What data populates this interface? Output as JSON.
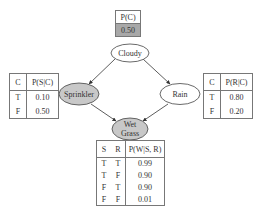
{
  "nodes": {
    "cloudy": {
      "label": "Cloudy",
      "fill": "#ffffff"
    },
    "sprinkler": {
      "label": "Sprinkler",
      "fill": "#c8c8c8"
    },
    "rain": {
      "label": "Rain",
      "fill": "#ffffff"
    },
    "wetgrass": {
      "label_line1": "Wet",
      "label_line2": "Grass",
      "fill": "#c8c8c8"
    }
  },
  "cpt_cloudy": {
    "header": "P(C)",
    "value": "0.50",
    "value_bg": "#a8a8a8"
  },
  "cpt_sprinkler": {
    "headers": [
      "C",
      "P(S|C)"
    ],
    "rows": [
      {
        "c": "T",
        "p": "0.10"
      },
      {
        "c": "F",
        "p": "0.50"
      }
    ]
  },
  "cpt_rain": {
    "headers": [
      "C",
      "P(R|C)"
    ],
    "rows": [
      {
        "c": "T",
        "p": "0.80"
      },
      {
        "c": "F",
        "p": "0.20"
      }
    ]
  },
  "cpt_wetgrass": {
    "headers": [
      "S",
      "R",
      "P(W|S, R)"
    ],
    "rows": [
      {
        "s": "T",
        "r": "T",
        "p": "0.99"
      },
      {
        "s": "T",
        "r": "F",
        "p": "0.90"
      },
      {
        "s": "F",
        "r": "T",
        "p": "0.90"
      },
      {
        "s": "F",
        "r": "F",
        "p": "0.01"
      }
    ]
  }
}
